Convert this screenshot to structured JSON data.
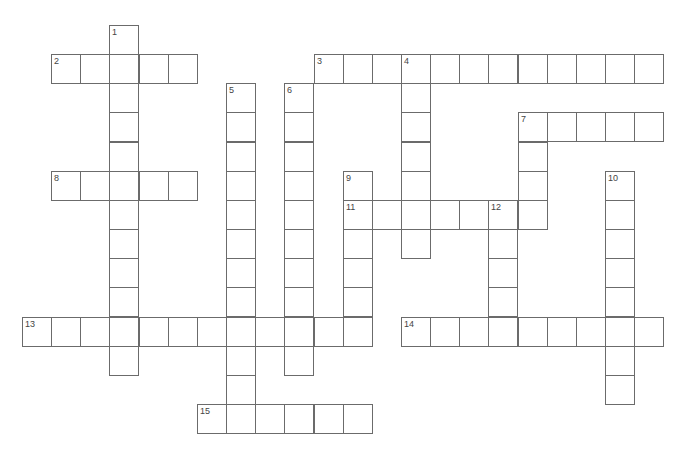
{
  "puzzle": {
    "type": "crossword",
    "cell_size": 29.15,
    "origin_x": 22,
    "origin_y": 25,
    "border_color": "#6b6b6b",
    "number_color": "#444444"
  },
  "words": [
    {
      "number": "1",
      "direction": "down",
      "row": 0,
      "col": 3,
      "length": 12
    },
    {
      "number": "2",
      "direction": "across",
      "row": 1,
      "col": 1,
      "length": 5
    },
    {
      "number": "3",
      "direction": "across",
      "row": 1,
      "col": 10,
      "length": 12
    },
    {
      "number": "4",
      "direction": "down",
      "row": 1,
      "col": 13,
      "length": 7
    },
    {
      "number": "5",
      "direction": "down",
      "row": 2,
      "col": 7,
      "length": 11
    },
    {
      "number": "6",
      "direction": "down",
      "row": 2,
      "col": 9,
      "length": 10
    },
    {
      "number": "7",
      "direction": "across",
      "row": 3,
      "col": 17,
      "length": 5
    },
    {
      "number": "7",
      "direction": "down",
      "row": 3,
      "col": 17,
      "length": 4
    },
    {
      "number": "8",
      "direction": "across",
      "row": 5,
      "col": 1,
      "length": 5
    },
    {
      "number": "9",
      "direction": "down",
      "row": 5,
      "col": 11,
      "length": 6
    },
    {
      "number": "10",
      "direction": "down",
      "row": 5,
      "col": 20,
      "length": 8
    },
    {
      "number": "11",
      "direction": "across",
      "row": 6,
      "col": 11,
      "length": 7
    },
    {
      "number": "12",
      "direction": "down",
      "row": 6,
      "col": 16,
      "length": 5
    },
    {
      "number": "13",
      "direction": "across",
      "row": 10,
      "col": 0,
      "length": 12
    },
    {
      "number": "14",
      "direction": "across",
      "row": 10,
      "col": 13,
      "length": 9
    },
    {
      "number": "15",
      "direction": "across",
      "row": 13,
      "col": 6,
      "length": 6
    }
  ]
}
